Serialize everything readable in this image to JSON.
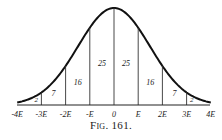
{
  "figure": {
    "caption": "Fig. 161."
  },
  "chart_data": {
    "type": "area",
    "xlabel": "",
    "ylabel": "",
    "x_ticks": [
      "-4E",
      "-3E",
      "-2E",
      "-E",
      "0",
      "E",
      "2E",
      "3E",
      "4E"
    ],
    "intervals": [
      {
        "from": "-4E",
        "to": "-3E",
        "value": 2
      },
      {
        "from": "-3E",
        "to": "-2E",
        "value": 7
      },
      {
        "from": "-2E",
        "to": "-E",
        "value": 16
      },
      {
        "from": "-E",
        "to": "0",
        "value": 25
      },
      {
        "from": "0",
        "to": "E",
        "value": 25
      },
      {
        "from": "E",
        "to": "2E",
        "value": 16
      },
      {
        "from": "2E",
        "to": "3E",
        "value": 7
      },
      {
        "from": "3E",
        "to": "4E",
        "value": 2
      }
    ],
    "categories": [
      "-4E..-3E",
      "-3E..-2E",
      "-2E..-E",
      "-E..0",
      "0..E",
      "E..2E",
      "2E..3E",
      "3E..4E"
    ],
    "values": [
      2,
      7,
      16,
      25,
      25,
      16,
      7,
      2
    ],
    "grid": false,
    "legend": "none"
  }
}
